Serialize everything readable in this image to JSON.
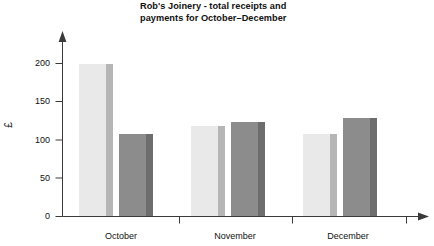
{
  "chart_data": {
    "type": "bar",
    "title": "Rob's Joinery - total receipts and\npayments for October–December",
    "title_line1": "Rob's Joinery - total receipts and",
    "title_line2": "payments for October–December",
    "xlabel": "",
    "ylabel": "£",
    "categories": [
      "October",
      "November",
      "December"
    ],
    "series": [
      {
        "name": "receipts",
        "values": [
          200,
          118,
          108
        ],
        "color": "#e9e9e9",
        "side_color": "#b5b5b5"
      },
      {
        "name": "payments",
        "values": [
          108,
          123,
          128
        ],
        "color": "#8c8c8c",
        "side_color": "#6d6d6d"
      }
    ],
    "ylim": [
      0,
      225
    ],
    "yticks": [
      0,
      50,
      100,
      150,
      200
    ],
    "ytick_labels": [
      "0",
      "50",
      "100",
      "150",
      "200"
    ],
    "grid": false,
    "legend": "none",
    "axis_arrows": true,
    "axis_color": "#3a3a3a"
  },
  "axis": {
    "y_label": "£",
    "y_tick_labels": [
      "200",
      "150",
      "100",
      "50",
      "0"
    ],
    "x_tick_labels": [
      "October",
      "November",
      "December"
    ]
  }
}
